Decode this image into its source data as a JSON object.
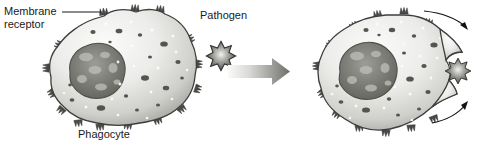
{
  "figure": {
    "background_color": "#ffffff",
    "text_color": "#1a1a1a"
  },
  "labels": {
    "membrane_receptor_line1": "Membrane",
    "membrane_receptor_line2": "receptor",
    "phagocyte": "Phagocyte",
    "pathogen": "Pathogen"
  },
  "colors": {
    "cell_light": "#f2f2f0",
    "cell_mid": "#c9c9c6",
    "cell_dark": "#9a9a96",
    "outline": "#3d3d3d",
    "nucleus_dark": "#6e6e6a",
    "nucleus_light": "#b4b4ae",
    "granule": "#5a5a56",
    "pathogen_dark": "#4a4a48",
    "pathogen_center": "#e8e8e6",
    "arrow_light": "#f0f0ee",
    "arrow_dark": "#6a6a66",
    "motion_arrow": "#111111"
  },
  "stages": [
    {
      "name": "before-engulfment",
      "caption": "Phagocyte",
      "receptors_visible": true,
      "pathogen_attached": false
    },
    {
      "name": "during-engulfment",
      "caption": "",
      "receptors_visible": true,
      "pathogen_attached": true,
      "motion_arrows": 2
    }
  ],
  "elements": {
    "leader_line": "membrane-receptor-leader",
    "transition_arrow": "right-arrow",
    "free_pathogen": "spiky-pathogen",
    "engulfed_pathogen": "spiky-pathogen-engulfed"
  }
}
